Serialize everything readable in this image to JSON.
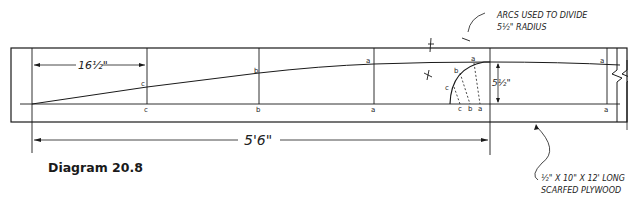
{
  "caption": "Diagram 20.8",
  "dimensions": {
    "spacing": "16½\"",
    "total_length": "5'6\"",
    "radius": "5½\""
  },
  "annotations": {
    "arcs_line1": "ARCS USED TO DIVIDE",
    "arcs_line2": "5½\" RADIUS",
    "plywood_line1": "½\" X 10\" X 12' LONG",
    "plywood_line2": "SCARFED PLYWOOD"
  },
  "station_labels": {
    "curve": [
      "c",
      "b",
      "a",
      "a"
    ],
    "baseline": [
      "c",
      "b",
      "a",
      "a"
    ],
    "arc_points": [
      "c",
      "b",
      "a"
    ],
    "arc_base": [
      "c",
      "b",
      "a"
    ]
  },
  "colors": {
    "ink": "#1a1a1a",
    "paper": "#ffffff"
  }
}
